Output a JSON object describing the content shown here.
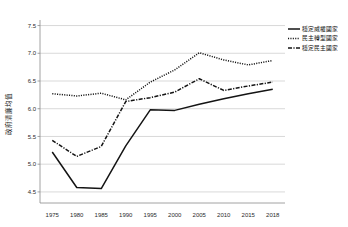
{
  "chart_data": {
    "type": "line",
    "title": "",
    "xlabel": "",
    "ylabel": "政府清廉均值",
    "categories": [
      "1975",
      "1980",
      "1985",
      "1990",
      "1995",
      "2000",
      "2005",
      "2010",
      "2015",
      "2018"
    ],
    "ylim": [
      4.3,
      7.6
    ],
    "yticks": [
      "7.5",
      "7.0",
      "6.5",
      "6.0",
      "5.5",
      "5.0",
      "4.5"
    ],
    "ytick_values": [
      7.5,
      7.0,
      6.5,
      6.0,
      5.5,
      5.0,
      4.5
    ],
    "grid": true,
    "legend_position": "right-top",
    "series": [
      {
        "name": "穩定威權國家",
        "style": "solid",
        "color": "#141414",
        "values": [
          5.22,
          4.58,
          4.56,
          5.33,
          5.98,
          5.97,
          6.08,
          6.18,
          6.27,
          6.35
        ]
      },
      {
        "name": "民主轉型國家",
        "style": "dotted",
        "color": "#141414",
        "values": [
          6.27,
          6.23,
          6.28,
          6.16,
          6.48,
          6.7,
          7.01,
          6.88,
          6.79,
          6.87
        ]
      },
      {
        "name": "穩定民主國家",
        "style": "dashdot",
        "color": "#141414",
        "values": [
          5.43,
          5.14,
          5.32,
          6.13,
          6.2,
          6.3,
          6.54,
          6.33,
          6.41,
          6.48
        ]
      }
    ]
  },
  "legend": {
    "items": [
      {
        "label": "穩定威權國家"
      },
      {
        "label": "民主轉型國家"
      },
      {
        "label": "穩定民主國家"
      }
    ]
  },
  "axes": {
    "y_title": "政府清廉均值"
  }
}
